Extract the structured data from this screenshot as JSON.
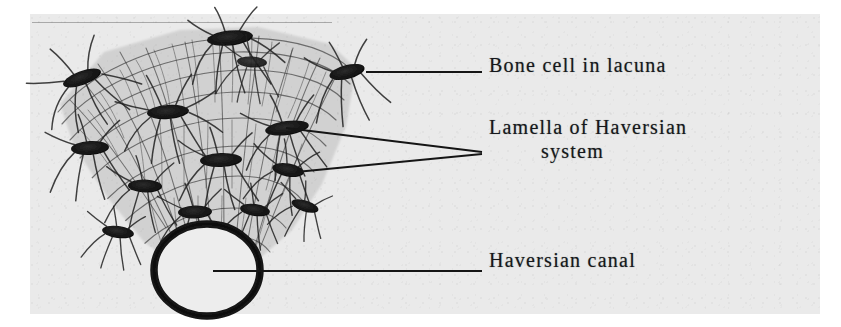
{
  "figure": {
    "kind": "histology-illustration",
    "background_color": "#eaeaea",
    "ink_color": "#1a1a1a",
    "structures": {
      "bone_cells_in_lacunae_count": 14,
      "haversian_canal_shape": "ellipse",
      "lamellae_description": "concentric layers of the Haversian system"
    }
  },
  "labels": [
    {
      "id": "bone-cell",
      "text": "Bone cell in lacuna",
      "continuation": "",
      "leader": "single"
    },
    {
      "id": "lamella",
      "text": "Lamella of Haversian",
      "continuation": "system",
      "leader": "double"
    },
    {
      "id": "haversian-canal",
      "text": "Haversian canal",
      "continuation": "",
      "leader": "single"
    }
  ]
}
